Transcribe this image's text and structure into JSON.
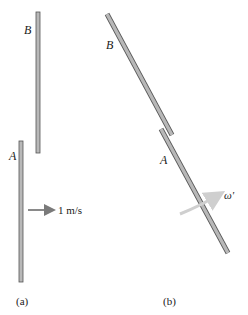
{
  "figure_a": {
    "caption": "(a)",
    "rods": [
      {
        "id": "B",
        "label": "B",
        "x1": 38,
        "y1": 12,
        "x2": 38,
        "y2": 153
      },
      {
        "id": "A",
        "label": "A",
        "x1": 21,
        "y1": 141,
        "x2": 21,
        "y2": 282
      }
    ],
    "velocity_arrow": {
      "label": "1 m/s",
      "x1": 28,
      "y1": 210,
      "x2": 55,
      "y2": 210
    }
  },
  "figure_b": {
    "caption": "(b)",
    "rods": [
      {
        "id": "B",
        "label": "B",
        "x1": 107,
        "y1": 14,
        "x2": 172,
        "y2": 135
      },
      {
        "id": "A",
        "label": "A",
        "x1": 162,
        "y1": 128,
        "x2": 228,
        "y2": 252
      }
    ],
    "angular_velocity": {
      "label": "ω'"
    }
  },
  "colors": {
    "rod_fill": "#b8b8b8",
    "rod_stroke": "#555555",
    "arrow": "#8a8a8a",
    "omega_arrow": "#cfcfcf",
    "text": "#1a1a1a"
  }
}
